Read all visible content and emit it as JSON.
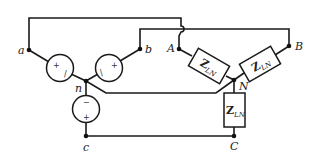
{
  "diagram": {
    "source_nodes": {
      "a": "a",
      "b": "b",
      "c": "c",
      "n": "n"
    },
    "load_nodes": {
      "A": "A",
      "B": "B",
      "C": "C",
      "N": "N"
    },
    "sources": [
      {
        "phase": "a",
        "plus": "+",
        "minus": "/"
      },
      {
        "phase": "b",
        "plus": "+",
        "minus": "\\"
      },
      {
        "phase": "c",
        "plus": "+",
        "minus": "−"
      }
    ],
    "impedances": [
      {
        "phase": "A",
        "symbol": "Z",
        "subscript": "LN"
      },
      {
        "phase": "B",
        "symbol": "Z",
        "subscript": "LN"
      },
      {
        "phase": "C",
        "symbol": "Z",
        "subscript": "LN"
      }
    ],
    "colors": {
      "line": "#1a1a1a",
      "background": "#ffffff"
    }
  }
}
